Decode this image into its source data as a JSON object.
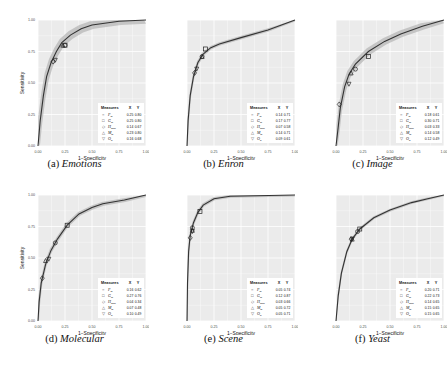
{
  "figure": {
    "layout": "2x3 grid of ROC curves",
    "panel_bg": "#ebebeb",
    "grid_color": "#ffffff",
    "curve_color": "#333333",
    "band_color": "#b3b3b3"
  },
  "chart_data": [
    {
      "type": "line",
      "label": "(a)",
      "title": "Emotions",
      "xlabel": "1−Specificity",
      "ylabel": "Sensitivity",
      "xlim": [
        0,
        1
      ],
      "ylim": [
        0,
        1
      ],
      "xticks": [
        "0.00",
        "0.25",
        "0.50",
        "0.75",
        "1.00"
      ],
      "yticks": [
        "0.00",
        "0.25",
        "0.50",
        "0.75",
        "1.00"
      ],
      "grid": true,
      "band_width": 0.03,
      "curve": [
        [
          0,
          0
        ],
        [
          0.02,
          0.2
        ],
        [
          0.05,
          0.4
        ],
        [
          0.08,
          0.55
        ],
        [
          0.12,
          0.66
        ],
        [
          0.17,
          0.75
        ],
        [
          0.22,
          0.82
        ],
        [
          0.3,
          0.88
        ],
        [
          0.4,
          0.93
        ],
        [
          0.5,
          0.96
        ],
        [
          0.75,
          0.99
        ],
        [
          1,
          1
        ]
      ],
      "legend": {
        "title": "Measures",
        "col_x": "X",
        "col_y": "Y",
        "position": "bottom-right",
        "entries": [
          {
            "marker": "circle",
            "name": "F_m",
            "x": "0.25",
            "y": "0.80"
          },
          {
            "marker": "square",
            "name": "G_m",
            "x": "0.25",
            "y": "0.80"
          },
          {
            "marker": "diamond",
            "name": "H_mea",
            "x": "0.14",
            "y": "0.67"
          },
          {
            "marker": "triangle-up",
            "name": "M_m",
            "x": "0.23",
            "y": "0.80"
          },
          {
            "marker": "triangle-down",
            "name": "O_p",
            "x": "0.16",
            "y": "0.68"
          }
        ]
      }
    },
    {
      "type": "line",
      "label": "(b)",
      "title": "Enron",
      "xlabel": "1−Specificity",
      "ylabel": "",
      "xlim": [
        0,
        1
      ],
      "ylim": [
        0,
        1
      ],
      "xticks": [
        "0.00",
        "0.25",
        "0.50",
        "0.75",
        "1.00"
      ],
      "yticks": [],
      "grid": true,
      "band_width": 0.012,
      "curve": [
        [
          0,
          0
        ],
        [
          0.01,
          0.2
        ],
        [
          0.03,
          0.4
        ],
        [
          0.06,
          0.55
        ],
        [
          0.1,
          0.66
        ],
        [
          0.15,
          0.73
        ],
        [
          0.22,
          0.78
        ],
        [
          0.3,
          0.81
        ],
        [
          0.5,
          0.86
        ],
        [
          0.75,
          0.92
        ],
        [
          1,
          1
        ]
      ],
      "legend": {
        "title": "Measures",
        "col_x": "X",
        "col_y": "Y",
        "position": "bottom-right",
        "entries": [
          {
            "marker": "circle",
            "name": "F_m",
            "x": "0.14",
            "y": "0.71"
          },
          {
            "marker": "square",
            "name": "G_m",
            "x": "0.17",
            "y": "0.77"
          },
          {
            "marker": "diamond",
            "name": "H_mea",
            "x": "0.07",
            "y": "0.58"
          },
          {
            "marker": "triangle-up",
            "name": "M_m",
            "x": "0.14",
            "y": "0.71"
          },
          {
            "marker": "triangle-down",
            "name": "O_p",
            "x": "0.09",
            "y": "0.61"
          }
        ]
      }
    },
    {
      "type": "line",
      "label": "(c)",
      "title": "Image",
      "xlabel": "1−Specificity",
      "ylabel": "",
      "xlim": [
        0,
        1
      ],
      "ylim": [
        0,
        1
      ],
      "xticks": [
        "0.00",
        "0.25",
        "0.50",
        "0.75",
        "1.00"
      ],
      "yticks": [],
      "grid": true,
      "band_width": 0.025,
      "curve": [
        [
          0,
          0
        ],
        [
          0.02,
          0.15
        ],
        [
          0.04,
          0.3
        ],
        [
          0.08,
          0.47
        ],
        [
          0.12,
          0.57
        ],
        [
          0.18,
          0.65
        ],
        [
          0.3,
          0.75
        ],
        [
          0.45,
          0.83
        ],
        [
          0.6,
          0.89
        ],
        [
          0.8,
          0.95
        ],
        [
          1,
          1
        ]
      ],
      "legend": {
        "title": "Measures",
        "col_x": "X",
        "col_y": "Y",
        "position": "bottom-right",
        "entries": [
          {
            "marker": "circle",
            "name": "F_m",
            "x": "0.18",
            "y": "0.61"
          },
          {
            "marker": "square",
            "name": "G_m",
            "x": "0.30",
            "y": "0.71"
          },
          {
            "marker": "diamond",
            "name": "H_mea",
            "x": "0.03",
            "y": "0.33"
          },
          {
            "marker": "triangle-up",
            "name": "M_m",
            "x": "0.14",
            "y": "0.58"
          },
          {
            "marker": "triangle-down",
            "name": "O_p",
            "x": "0.12",
            "y": "0.49"
          }
        ]
      }
    },
    {
      "type": "line",
      "label": "(d)",
      "title": "Molecular",
      "xlabel": "1−Specificity",
      "ylabel": "Sensitivity",
      "xlim": [
        0,
        1
      ],
      "ylim": [
        0,
        1
      ],
      "xticks": [
        "0.00",
        "0.25",
        "0.50",
        "0.75",
        "1.00"
      ],
      "yticks": [
        "0.00",
        "0.25",
        "0.50",
        "0.75",
        "1.00"
      ],
      "grid": true,
      "band_width": 0.015,
      "curve": [
        [
          0,
          0
        ],
        [
          0.01,
          0.15
        ],
        [
          0.03,
          0.3
        ],
        [
          0.07,
          0.45
        ],
        [
          0.12,
          0.56
        ],
        [
          0.18,
          0.65
        ],
        [
          0.27,
          0.76
        ],
        [
          0.38,
          0.85
        ],
        [
          0.5,
          0.9
        ],
        [
          0.6,
          0.93
        ],
        [
          0.8,
          0.96
        ],
        [
          1,
          1
        ]
      ],
      "legend": {
        "title": "Measures",
        "col_x": "X",
        "col_y": "Y",
        "position": "bottom-right",
        "entries": [
          {
            "marker": "circle",
            "name": "F_m",
            "x": "0.16",
            "y": "0.62"
          },
          {
            "marker": "square",
            "name": "G_m",
            "x": "0.27",
            "y": "0.76"
          },
          {
            "marker": "diamond",
            "name": "H_mea",
            "x": "0.04",
            "y": "0.34"
          },
          {
            "marker": "triangle-up",
            "name": "M_m",
            "x": "0.07",
            "y": "0.48"
          },
          {
            "marker": "triangle-down",
            "name": "O_p",
            "x": "0.10",
            "y": "0.49"
          }
        ]
      }
    },
    {
      "type": "line",
      "label": "(e)",
      "title": "Scene",
      "xlabel": "1−Specificity",
      "ylabel": "",
      "xlim": [
        0,
        1
      ],
      "ylim": [
        0,
        1
      ],
      "xticks": [
        "0.00",
        "0.25",
        "0.50",
        "0.75",
        "1.00"
      ],
      "yticks": [],
      "grid": true,
      "band_width": 0.012,
      "curve": [
        [
          0,
          0
        ],
        [
          0.005,
          0.3
        ],
        [
          0.015,
          0.55
        ],
        [
          0.03,
          0.68
        ],
        [
          0.06,
          0.78
        ],
        [
          0.1,
          0.86
        ],
        [
          0.15,
          0.92
        ],
        [
          0.25,
          0.97
        ],
        [
          0.4,
          0.99
        ],
        [
          1,
          1
        ]
      ],
      "legend": {
        "title": "Measures",
        "col_x": "X",
        "col_y": "Y",
        "position": "bottom-right",
        "entries": [
          {
            "marker": "circle",
            "name": "F_m",
            "x": "0.05",
            "y": "0.74"
          },
          {
            "marker": "square",
            "name": "G_m",
            "x": "0.12",
            "y": "0.87"
          },
          {
            "marker": "diamond",
            "name": "H_mea",
            "x": "0.03",
            "y": "0.66"
          },
          {
            "marker": "triangle-up",
            "name": "M_m",
            "x": "0.05",
            "y": "0.72"
          },
          {
            "marker": "triangle-down",
            "name": "O_p",
            "x": "0.05",
            "y": "0.71"
          }
        ]
      }
    },
    {
      "type": "line",
      "label": "(f)",
      "title": "Yeast",
      "xlabel": "1−Specificity",
      "ylabel": "",
      "xlim": [
        0,
        1
      ],
      "ylim": [
        0,
        1
      ],
      "xticks": [
        "0.00",
        "0.25",
        "0.50",
        "0.75",
        "1.00"
      ],
      "yticks": [],
      "grid": true,
      "band_width": 0.01,
      "curve": [
        [
          0,
          0
        ],
        [
          0.02,
          0.2
        ],
        [
          0.05,
          0.38
        ],
        [
          0.1,
          0.55
        ],
        [
          0.15,
          0.65
        ],
        [
          0.22,
          0.73
        ],
        [
          0.35,
          0.82
        ],
        [
          0.5,
          0.88
        ],
        [
          0.7,
          0.94
        ],
        [
          0.85,
          0.97
        ],
        [
          1,
          1
        ]
      ],
      "legend": {
        "title": "Measures",
        "col_x": "X",
        "col_y": "Y",
        "position": "bottom-right",
        "entries": [
          {
            "marker": "circle",
            "name": "F_m",
            "x": "0.20",
            "y": "0.71"
          },
          {
            "marker": "square",
            "name": "G_m",
            "x": "0.22",
            "y": "0.73"
          },
          {
            "marker": "diamond",
            "name": "H_mea",
            "x": "0.14",
            "y": "0.65"
          },
          {
            "marker": "triangle-up",
            "name": "M_m",
            "x": "0.15",
            "y": "0.65"
          },
          {
            "marker": "triangle-down",
            "name": "O_p",
            "x": "0.15",
            "y": "0.65"
          }
        ]
      }
    }
  ],
  "captions": [
    {
      "label": "(a)",
      "name": "Emotions"
    },
    {
      "label": "(b)",
      "name": "Enron"
    },
    {
      "label": "(c)",
      "name": "Image"
    },
    {
      "label": "(d)",
      "name": "Molecular"
    },
    {
      "label": "(e)",
      "name": "Scene"
    },
    {
      "label": "(f)",
      "name": "Yeast"
    }
  ]
}
